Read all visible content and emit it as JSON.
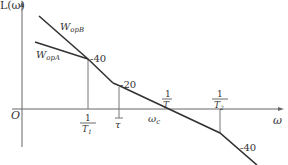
{
  "diagram": {
    "type": "bode-asymptotic-magnitude-plot",
    "y_axis_label": "L(ω)",
    "x_axis_label": "ω",
    "origin_label": "O",
    "curves": [
      {
        "name": "W_opB",
        "label_main": "W",
        "label_sub": "opB"
      },
      {
        "name": "W_opA",
        "label_main": "W",
        "label_sub": "opA"
      }
    ],
    "slope_labels": [
      "-40",
      "-20",
      "-40"
    ],
    "break_frequencies": [
      {
        "num": "1",
        "den": "T",
        "den_sub": "1"
      },
      {
        "num": "",
        "den": "τ",
        "den_sub": ""
      },
      {
        "num": "1",
        "den": "T",
        "den_sub": ""
      },
      {
        "num": "1",
        "den": "T",
        "den_sub": "2"
      }
    ],
    "crossover_label": {
      "main": "ω",
      "sub": "c"
    },
    "colors": {
      "lines": "#333333",
      "axes": "#555555"
    }
  }
}
